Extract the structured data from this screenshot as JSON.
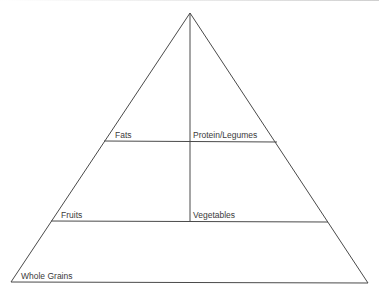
{
  "diagram": {
    "type": "food-pyramid",
    "line_color": "#4a4a4a",
    "text_color": "#3a3a3a",
    "background": "#ffffff",
    "tiers": [
      {
        "level": "top",
        "sections": [
          {
            "position": "left",
            "label": "Fats"
          },
          {
            "position": "right",
            "label": "Protein/Legumes"
          }
        ]
      },
      {
        "level": "middle",
        "sections": [
          {
            "position": "left",
            "label": "Fruits"
          },
          {
            "position": "right",
            "label": "Vegetables"
          }
        ]
      },
      {
        "level": "bottom",
        "sections": [
          {
            "position": "full",
            "label": "Whole Grains"
          }
        ]
      }
    ]
  }
}
